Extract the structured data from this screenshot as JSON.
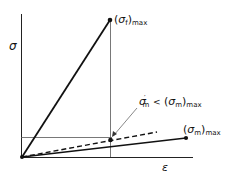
{
  "diagram": {
    "type": "stress-strain",
    "axes": {
      "y_label": "σ",
      "x_label": "ε"
    },
    "labels": {
      "fiber_max": {
        "paren_open": "(",
        "symbol": "σ",
        "sub": "f",
        "paren_close": ")",
        "suffix": "max"
      },
      "matrix_max": {
        "paren_open": "(",
        "symbol": "σ",
        "sub": "m",
        "paren_close": ")",
        "suffix": "max"
      },
      "matrix_prime": {
        "symbol": "σ",
        "prime": "′",
        "sub": "m",
        "relation": "<",
        "paren_open": "(",
        "symbol2": "σ",
        "sub2": "m",
        "paren_close": ")",
        "suffix": "max"
      }
    },
    "lines": [
      {
        "name": "fiber",
        "style": "solid",
        "from": [
          22,
          157
        ],
        "to": [
          110,
          20
        ]
      },
      {
        "name": "matrix",
        "style": "solid",
        "from": [
          22,
          157
        ],
        "to": [
          186,
          138
        ]
      },
      {
        "name": "composite-matrix-dashed",
        "style": "dashed",
        "from": [
          22,
          157
        ],
        "to": [
          157,
          132
        ]
      }
    ],
    "points": [
      {
        "name": "fiber-max-point",
        "at": [
          110,
          20
        ]
      },
      {
        "name": "matrix-max-point",
        "at": [
          186,
          138
        ]
      },
      {
        "name": "matrix-prime-point",
        "at": [
          110,
          140
        ]
      }
    ],
    "colors": {
      "ink": "#111111",
      "thin": "#555555"
    }
  }
}
